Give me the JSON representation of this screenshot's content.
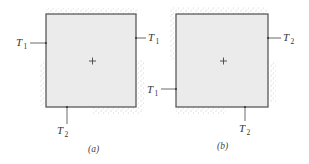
{
  "figure": {
    "panels": [
      {
        "caption": "(a)",
        "labels": {
          "left": {
            "main": "T",
            "sub": "1"
          },
          "right": {
            "main": "T",
            "sub": "1"
          },
          "bottom": {
            "main": "T",
            "sub": "2"
          }
        },
        "center_marker": "+",
        "insulated_regions": [
          "top edge",
          "lower left side",
          "lower right side",
          "right portion of bottom edge"
        ]
      },
      {
        "caption": "(b)",
        "labels": {
          "right": {
            "main": "T",
            "sub": "2"
          },
          "left": {
            "main": "T",
            "sub": "1"
          },
          "bottom": {
            "main": "T",
            "sub": "2"
          }
        },
        "center_marker": "+",
        "insulated_regions": [
          "top edge",
          "upper left side",
          "lower right side",
          "left portion of bottom edge"
        ]
      }
    ],
    "colors": {
      "fill": "#ebebeb",
      "border": "#5a5a5a",
      "stipple": "#9a9a9a"
    }
  }
}
